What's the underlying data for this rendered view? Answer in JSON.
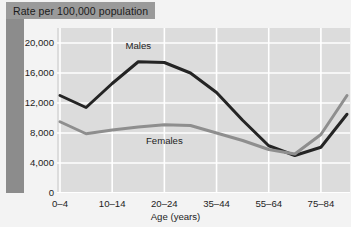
{
  "title_banner": {
    "text": "Rate per 100,000 population"
  },
  "chart_data": {
    "type": "line",
    "title": "Rate per 100,000 population",
    "xlabel": "Age (years)",
    "ylabel": "Rate per 100,000 population",
    "ylim": [
      0,
      22000
    ],
    "yticks": [
      0,
      4000,
      8000,
      12000,
      16000,
      20000
    ],
    "ytick_labels": [
      "0",
      "4,000",
      "8,000",
      "12,000",
      "16,000",
      "20,000"
    ],
    "grid": true,
    "legend_position": "inline-annotations",
    "categories": [
      "0–4",
      "5–9",
      "10–14",
      "15–19",
      "20–24",
      "25–34",
      "35–44",
      "45–54",
      "55–64",
      "65–74",
      "75–84",
      "85+"
    ],
    "xtick_labels": [
      "0–4",
      "10–14",
      "20–24",
      "35–44",
      "55–64",
      "75–84"
    ],
    "xtick_indices": [
      0,
      2,
      4,
      6,
      8,
      10
    ],
    "series": [
      {
        "name": "Males",
        "color": "#242424",
        "values": [
          13000,
          11400,
          14600,
          17500,
          17400,
          16000,
          13400,
          9700,
          6300,
          5000,
          6100,
          10500
        ]
      },
      {
        "name": "Females",
        "color": "#8e8e8e",
        "values": [
          9500,
          7900,
          8400,
          8800,
          9100,
          9000,
          8000,
          7000,
          5800,
          5200,
          7800,
          13000
        ]
      }
    ],
    "annotations": [
      {
        "text": "Males",
        "x_index": 3,
        "y_value": 19600
      },
      {
        "text": "Females",
        "x_index": 4,
        "y_value": 7000
      }
    ]
  }
}
